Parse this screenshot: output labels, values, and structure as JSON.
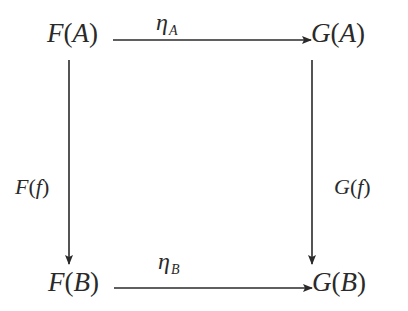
{
  "diagram": {
    "type": "commutative-square",
    "nodes": {
      "top_left": {
        "functor": "F",
        "object": "A"
      },
      "top_right": {
        "functor": "G",
        "object": "A"
      },
      "bottom_left": {
        "functor": "F",
        "object": "B"
      },
      "bottom_right": {
        "functor": "G",
        "object": "B"
      }
    },
    "arrows": {
      "top": {
        "symbol": "η",
        "subscript": "A",
        "from": "F(A)",
        "to": "G(A)"
      },
      "bottom": {
        "symbol": "η",
        "subscript": "B",
        "from": "F(B)",
        "to": "G(B)"
      },
      "left": {
        "functor": "F",
        "morphism": "f",
        "from": "F(A)",
        "to": "F(B)"
      },
      "right": {
        "functor": "G",
        "morphism": "f",
        "from": "G(A)",
        "to": "G(B)"
      }
    },
    "paren_open": "(",
    "paren_close": ")",
    "colors": {
      "ink": "#2a2a2a",
      "background": "#ffffff"
    }
  }
}
